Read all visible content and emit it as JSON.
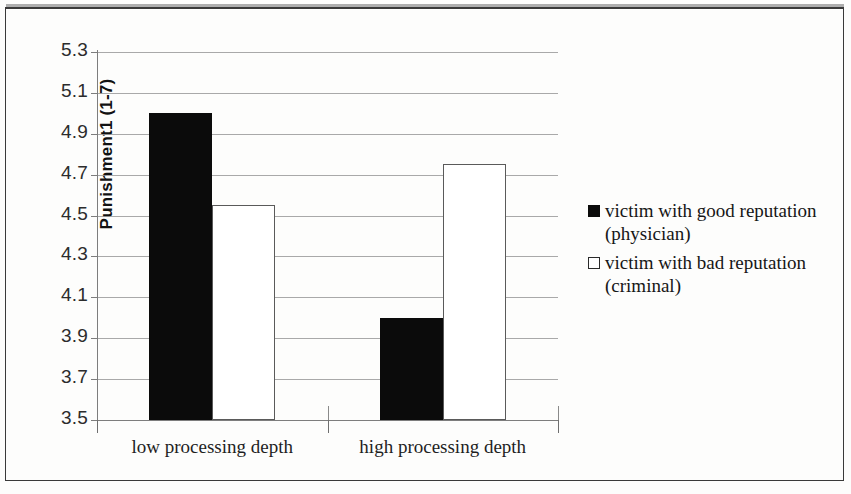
{
  "chart_data": {
    "type": "bar",
    "title": "",
    "subtitle": "",
    "xlabel": "",
    "ylabel": "Punishment1 (1-7)",
    "categories": [
      "low processing depth",
      "high processing depth"
    ],
    "series": [
      {
        "name": "victim with good reputation (physician)",
        "marker": "filled-square",
        "color": "#0b0b0b",
        "values": [
          5.0,
          4.0
        ]
      },
      {
        "name": "victim with bad reputation (criminal)",
        "marker": "open-square",
        "color": "#ffffff",
        "values": [
          4.55,
          4.75
        ]
      }
    ],
    "ylim": [
      3.5,
      5.3
    ],
    "ytick_step": 0.2,
    "ytick_labels": [
      "5.3",
      "5.1",
      "4.9",
      "4.7",
      "4.5",
      "4.3",
      "4.1",
      "3.9",
      "3.7",
      "3.5"
    ],
    "grid": true,
    "grid_axis": "y",
    "legend_position": "right"
  },
  "legend": {
    "entries": [
      {
        "line1": "victim with good reputation",
        "line2": "(physician)",
        "marker": "filled-square"
      },
      {
        "line1": "victim with bad reputation",
        "line2": "(criminal)",
        "marker": "open-square"
      }
    ]
  },
  "axis": {
    "y_title": "Punishment1 (1-7)",
    "ticks": [
      "5.3",
      "5.1",
      "4.9",
      "4.7",
      "4.5",
      "4.3",
      "4.1",
      "3.9",
      "3.7",
      "3.5"
    ],
    "x_categories": [
      "low processing depth",
      "high processing depth"
    ]
  },
  "colors": {
    "series_good": "#0b0b0b",
    "series_bad": "#ffffff",
    "grid": "#9a9a9a",
    "axis": "#7d7d7d",
    "frame": "#3a3a3a"
  }
}
